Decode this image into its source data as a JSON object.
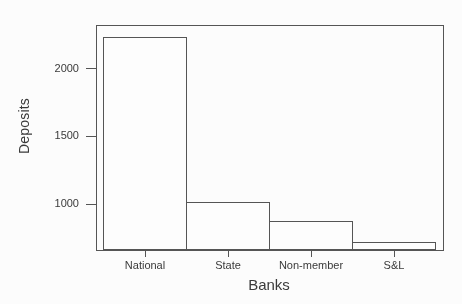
{
  "chart_data": {
    "type": "bar",
    "title": "",
    "xlabel": "Banks",
    "ylabel": "Deposits",
    "categories": [
      "National",
      "State",
      "Non-member",
      "S&L"
    ],
    "values": [
      2230,
      1010,
      870,
      715
    ],
    "yticks": [
      1000,
      1500,
      2000
    ],
    "ylim": [
      658,
      2312
    ],
    "grid": false,
    "legend": false,
    "bar_style": "outlined, unfilled, adjacent bars"
  },
  "colors": {
    "line": "#555555",
    "text": "#3a3a3a",
    "background": "#fcfcfc",
    "bar_fill": "#fdfdfd"
  }
}
